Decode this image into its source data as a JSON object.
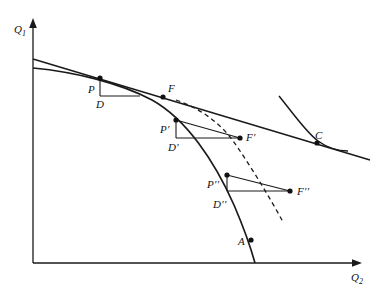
{
  "figure": {
    "type": "economics-ppf-diagram",
    "width": 383,
    "height": 297,
    "background_color": "#ffffff",
    "line_color": "#1a1a1a"
  },
  "axes": {
    "y_axis": {
      "label": "Q",
      "subscript": "1",
      "name": "Q1"
    },
    "x_axis": {
      "label": "Q",
      "subscript": "2",
      "name": "Q2"
    },
    "origin": {
      "x": 33,
      "y": 263
    },
    "y_top": {
      "x": 33,
      "y": 22
    },
    "x_right": {
      "x": 360,
      "y": 263
    }
  },
  "points": [
    {
      "id": "P",
      "label": "P",
      "x": 100,
      "y": 78,
      "label_x": 88,
      "label_y": 84
    },
    {
      "id": "D",
      "label": "D",
      "x": 100,
      "y": 96,
      "label_x": 96,
      "label_y": 99
    },
    {
      "id": "F",
      "label": "F",
      "x": 163,
      "y": 97,
      "label_x": 168,
      "label_y": 83
    },
    {
      "id": "Pp",
      "label": "P′",
      "x": 176,
      "y": 120,
      "label_x": 162,
      "label_y": 124
    },
    {
      "id": "Dp",
      "label": "D′",
      "x": 176,
      "y": 138,
      "label_x": 170,
      "label_y": 142
    },
    {
      "id": "Fp",
      "label": "F′",
      "x": 240,
      "y": 138,
      "label_x": 246,
      "label_y": 132
    },
    {
      "id": "Ppp",
      "label": "P′′",
      "x": 227,
      "y": 175,
      "label_x": 209,
      "label_y": 179
    },
    {
      "id": "Dpp",
      "label": "D′′",
      "x": 227,
      "y": 191,
      "label_x": 215,
      "label_y": 199
    },
    {
      "id": "Fpp",
      "label": "F′′",
      "x": 290,
      "y": 191,
      "label_x": 297,
      "label_y": 186
    },
    {
      "id": "A",
      "label": "A",
      "x": 251,
      "y": 240,
      "label_x": 240,
      "label_y": 238
    },
    {
      "id": "C",
      "label": "C",
      "x": 317,
      "y": 143,
      "label_x": 316,
      "label_y": 132
    }
  ],
  "curves": {
    "price_line": {
      "name": "price-line",
      "description": "straight relative-price / budget line tangent to PPF",
      "path": "M 33 59 L 370 160"
    },
    "ppf": {
      "name": "ppf-curve",
      "description": "concave production possibility frontier",
      "path": "M 33 68 C 75 72 120 83 152 100 C 186 119 214 160 234 205 C 243 226 250 245 255 263"
    },
    "dashed_locus": {
      "name": "dashed-consumption-locus",
      "description": "dashed curve through F, F prime, F double prime",
      "path": "M 176 100 C 200 108 222 124 236 145 C 253 170 270 198 283 222"
    },
    "indifference_curve": {
      "name": "indifference-curve",
      "description": "indifference curve tangent to the price line at C",
      "path": "M 279 96 C 296 117 306 132 318 141 C 329 149 338 151 348 151"
    },
    "triangles": [
      {
        "name": "triangle-P-D-F",
        "vertical": "M 100 78 L 100 96",
        "horizontal": "M 100 96 L 140 96",
        "ray": null
      },
      {
        "name": "triangle-Pprime-Dprime-Fprime",
        "vertical": "M 176 120 L 176 138",
        "horizontal": "M 176 138 L 240 138",
        "ray": "M 176 120 L 240 138"
      },
      {
        "name": "triangle-Pdoubleprime-Ddoubleprime-Fdoubleprime",
        "vertical": "M 227 175 L 227 191",
        "horizontal": "M 227 191 L 290 191",
        "ray": "M 227 175 L 290 191"
      }
    ]
  }
}
